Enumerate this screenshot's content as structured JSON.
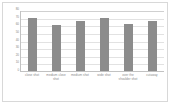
{
  "chart_data": {
    "type": "bar",
    "title": "",
    "xlabel": "",
    "ylabel": "",
    "categories": [
      "close shot",
      "medium close shot",
      "medium shot",
      "wide shot",
      "over the shoulder shot",
      "cutaway"
    ],
    "values": [
      70,
      60,
      65,
      70,
      62,
      66
    ],
    "ylim": [
      0,
      80
    ],
    "yticks": [
      0,
      10,
      20,
      30,
      40,
      50,
      60,
      70,
      80
    ],
    "ytick_labels": [
      "0",
      "10",
      "20",
      "30",
      "40",
      "50",
      "60",
      "70",
      "80"
    ],
    "grid": true,
    "legend": false,
    "bar_color": "#8c8c8c",
    "grid_color": "#e2e2e2",
    "axis_color": "#c2c2c2",
    "tick_label_color": "#8a8a8a",
    "background": "#ffffff",
    "border_color": "#d8d8d8"
  }
}
